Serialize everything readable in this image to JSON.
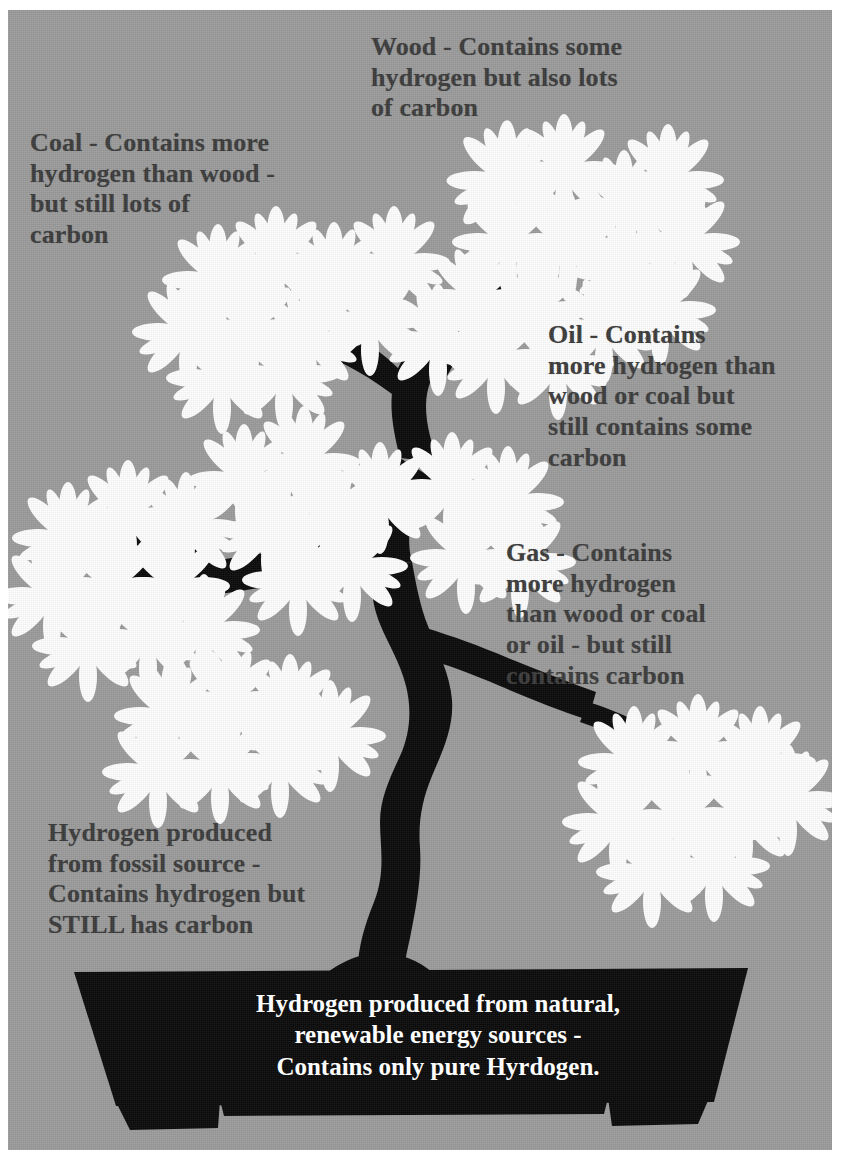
{
  "image": {
    "title": "Hydrogen sources tree diagram",
    "background_color": "#9c9c9c",
    "ink_color": "#0a0a0a",
    "foliage_color": "#ffffff",
    "text_color": "#3b3b3b",
    "pot_text_color": "#ffffff"
  },
  "annotations": {
    "wood": {
      "label": "wood-annotation",
      "lines": [
        "Wood - Contains some",
        "hydrogen but also lots",
        "of carbon"
      ]
    },
    "coal": {
      "label": "coal-annotation",
      "lines": [
        "Coal - Contains more",
        "hydrogen than wood -",
        "but still lots of",
        "carbon"
      ]
    },
    "oil": {
      "label": "oil-annotation",
      "lines": [
        "  Oil - Contains",
        "more hydrogen than",
        "wood or coal  but",
        "still contains some",
        "carbon"
      ]
    },
    "gas": {
      "label": "gas-annotation",
      "lines": [
        " Gas  - Contains",
        "more hydrogen",
        "than wood or coal",
        "or oil - but still",
        "contains carbon"
      ]
    },
    "fossil_hydrogen": {
      "label": "fossil-hydrogen-annotation",
      "lines": [
        "Hydrogen produced",
        "from fossil source -",
        "Contains hydrogen but",
        "STILL has carbon"
      ]
    }
  },
  "pot": {
    "label": "pot-caption",
    "lines": [
      "Hydrogen produced from natural,",
      "renewable energy sources -",
      "Contains only pure Hyrdogen."
    ]
  },
  "tree": {
    "trunk_icon": "tree-trunk-icon",
    "foliage_icon": "foliage-cluster-icon",
    "pot_icon": "plant-pot-icon"
  }
}
